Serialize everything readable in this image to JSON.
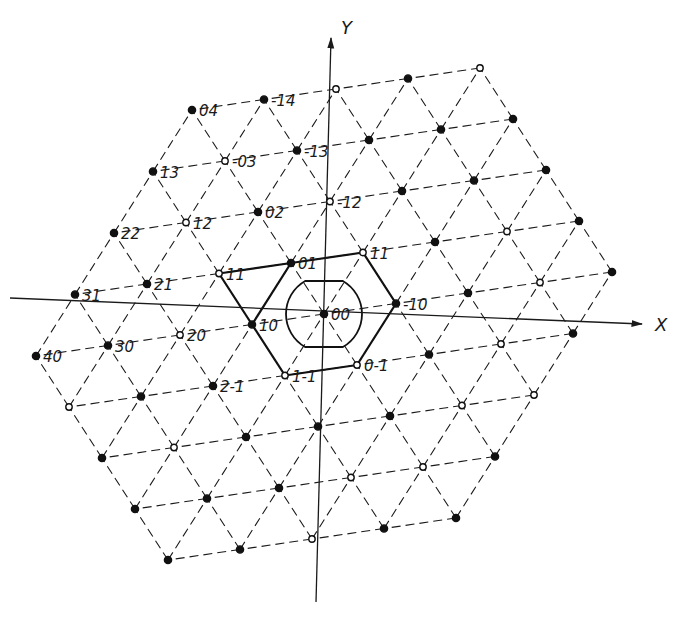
{
  "diagram": {
    "title": "",
    "axes": {
      "x_label": "X",
      "y_label": "Y"
    },
    "lattice": {
      "type": "triangular",
      "radius": 4,
      "origin_px": [
        324,
        314
      ],
      "e1_px": [
        -72,
        10.5
      ],
      "e2_px": [
        -33,
        -51
      ],
      "line_color": "#1a1a1a"
    },
    "node_labels": [
      {
        "h": 0,
        "k": 4,
        "text": "04"
      },
      {
        "h": -1,
        "k": 4,
        "text": "-14"
      },
      {
        "h": 1,
        "k": 3,
        "text": "13"
      },
      {
        "h": 0,
        "k": 3,
        "text": "-03"
      },
      {
        "h": -1,
        "k": 3,
        "text": "-13"
      },
      {
        "h": 2,
        "k": 2,
        "text": "22"
      },
      {
        "h": 1,
        "k": 2,
        "text": "12"
      },
      {
        "h": 0,
        "k": 2,
        "text": "02"
      },
      {
        "h": -1,
        "k": 2,
        "text": "-12"
      },
      {
        "h": 3,
        "k": 1,
        "text": "31"
      },
      {
        "h": 2,
        "k": 1,
        "text": "21"
      },
      {
        "h": 1,
        "k": 1,
        "text": "11"
      },
      {
        "h": 0,
        "k": 1,
        "text": "01"
      },
      {
        "h": -1,
        "k": 1,
        "text": "11"
      },
      {
        "h": 4,
        "k": 0,
        "text": "40"
      },
      {
        "h": 3,
        "k": 0,
        "text": "30"
      },
      {
        "h": 2,
        "k": 0,
        "text": "20"
      },
      {
        "h": 1,
        "k": 0,
        "text": "10"
      },
      {
        "h": 0,
        "k": 0,
        "text": "00"
      },
      {
        "h": -1,
        "k": 0,
        "text": "-10"
      },
      {
        "h": 2,
        "k": -1,
        "text": "2-1"
      },
      {
        "h": 1,
        "k": -1,
        "text": "1-1"
      },
      {
        "h": 0,
        "k": -1,
        "text": "0-1"
      }
    ],
    "open_nodes": [
      [
        1,
        1
      ],
      [
        -1,
        2
      ],
      [
        0,
        -1
      ],
      [
        1,
        -1
      ],
      [
        -1,
        1
      ],
      [
        0,
        3
      ],
      [
        -2,
        4
      ],
      [
        1,
        2
      ],
      [
        2,
        0
      ],
      [
        0,
        -3
      ],
      [
        -2,
        -1
      ],
      [
        3,
        -2
      ],
      [
        1,
        -3
      ],
      [
        -3,
        1
      ],
      [
        4,
        -1
      ],
      [
        2,
        -4
      ],
      [
        -1,
        -2
      ],
      [
        -3,
        0
      ],
      [
        -4,
        4
      ],
      [
        -2,
        -2
      ]
    ],
    "bold_segments": [
      [
        [
          1,
          1
        ],
        [
          0,
          1
        ]
      ],
      [
        [
          0,
          1
        ],
        [
          -1,
          1
        ]
      ],
      [
        [
          -1,
          1
        ],
        [
          -1,
          0
        ]
      ],
      [
        [
          -1,
          0
        ],
        [
          0,
          -1
        ]
      ],
      [
        [
          0,
          -1
        ],
        [
          1,
          -1
        ]
      ],
      [
        [
          1,
          -1
        ],
        [
          1,
          0
        ]
      ],
      [
        [
          1,
          0
        ],
        [
          1,
          1
        ]
      ],
      [
        [
          1,
          0
        ],
        [
          0,
          1
        ]
      ]
    ],
    "inner_cell": {
      "shape": "truncated-circle",
      "radius": 38,
      "flat_half_height": 33
    }
  }
}
